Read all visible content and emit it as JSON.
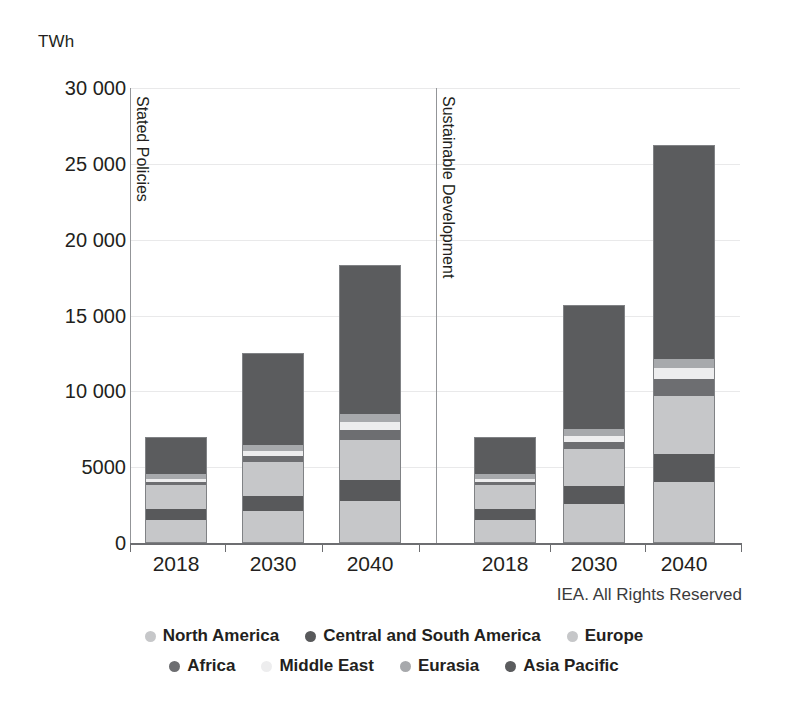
{
  "chart_data": {
    "type": "bar",
    "subtype": "stacked",
    "title": "",
    "subtitle": "",
    "xlabel": "",
    "ylabel": "TWh",
    "unit_label": "TWh",
    "ylim": [
      0,
      30000
    ],
    "yticks": [
      0,
      5000,
      10000,
      15000,
      20000,
      25000,
      30000
    ],
    "ytick_labels": [
      "0",
      "5000",
      "10 000",
      "15 000",
      "20 000",
      "25 000",
      "30 000"
    ],
    "grid": true,
    "legend_position": "bottom",
    "attribution": "IEA. All Rights Reserved",
    "panels": [
      {
        "name": "Stated Policies",
        "categories": [
          "2018",
          "2030",
          "2040"
        ]
      },
      {
        "name": "Sustainable Development",
        "categories": [
          "2018",
          "2030",
          "2040"
        ]
      }
    ],
    "categories": [
      "2018",
      "2030",
      "2040",
      "2018",
      "2030",
      "2040"
    ],
    "series": [
      {
        "name": "North America",
        "color": "#c6c7c9",
        "values": [
          1500,
          2050,
          2750,
          1500,
          2550,
          4000
        ]
      },
      {
        "name": "Central and South America",
        "color": "#58595b",
        "values": [
          700,
          1050,
          1350,
          700,
          1150,
          1850
        ]
      },
      {
        "name": "Europe",
        "color": "#c6c7c9",
        "values": [
          1650,
          2200,
          2650,
          1650,
          2500,
          3850
        ]
      },
      {
        "name": "Africa",
        "color": "#6d6e71",
        "values": [
          200,
          400,
          700,
          200,
          450,
          1100
        ]
      },
      {
        "name": "Middle East",
        "color": "#ededee",
        "values": [
          200,
          350,
          550,
          200,
          400,
          750
        ]
      },
      {
        "name": "Eurasia",
        "color": "#a7a9ac",
        "values": [
          350,
          400,
          500,
          350,
          450,
          600
        ]
      },
      {
        "name": "Asia Pacific",
        "color": "#5b5c5e",
        "values": [
          2400,
          6100,
          9800,
          2400,
          8200,
          14100
        ]
      }
    ],
    "totals": [
      7000,
      12550,
      18300,
      7000,
      15700,
      26250
    ]
  },
  "legend": {
    "rows": [
      [
        {
          "label": "North America",
          "color": "#c6c7c9"
        },
        {
          "label": "Central and South America",
          "color": "#58595b"
        },
        {
          "label": "Europe",
          "color": "#c6c7c9"
        }
      ],
      [
        {
          "label": "Africa",
          "color": "#6d6e71"
        },
        {
          "label": "Middle East",
          "color": "#ededee"
        },
        {
          "label": "Eurasia",
          "color": "#a7a9ac"
        },
        {
          "label": "Asia Pacific",
          "color": "#5b5c5e"
        }
      ]
    ]
  }
}
